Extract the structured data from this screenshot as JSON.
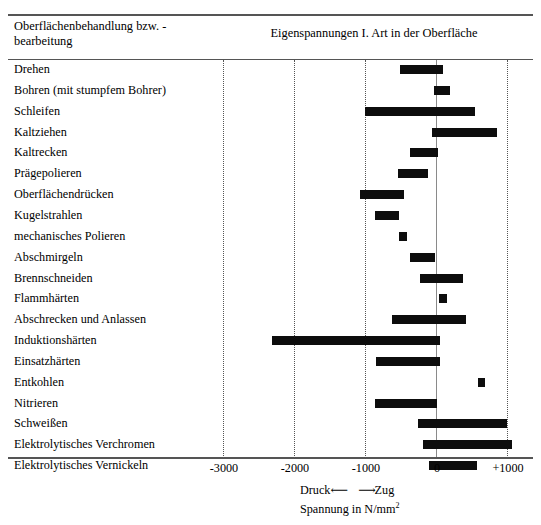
{
  "header": {
    "left_title": "Oberflächenbehandlung bzw. -bearbeitung",
    "right_title": "Eigenspannungen I. Art in der Oberfläche"
  },
  "caption": {
    "line1_left": "Druck",
    "line1_arrow": "⟵ ⟶",
    "line1_right": "Zug",
    "line2": "Spannung in N/mm",
    "line2_sup": "2"
  },
  "axis": {
    "ticks": [
      "-3000",
      "-2000",
      "-1000",
      "0",
      "+1000"
    ],
    "tick_values": [
      -3000,
      -2000,
      -1000,
      0,
      1000
    ]
  },
  "chart_data": {
    "type": "bar",
    "title": "Eigenspannungen I. Art in der Oberfläche",
    "xlabel": "Spannung in N/mm²",
    "ylabel": "Oberflächenbehandlung bzw. -bearbeitung",
    "xlim": [
      -3400,
      1200
    ],
    "orientation": "horizontal",
    "bar_type": "range",
    "grid": true,
    "legend": "none",
    "categories": [
      "Drehen",
      "Bohren (mit stumpfem Bohrer)",
      "Schleifen",
      "Kaltziehen",
      "Kaltrecken",
      "Prägepolieren",
      "Oberflächendrücken",
      "Kugelstrahlen",
      "mechanisches Polieren",
      "Abschmirgeln",
      "Brennschneiden",
      "Flammhärten",
      "Abschrecken und Anlassen",
      "Induktionshärten",
      "Einsatzhärten",
      "Entkohlen",
      "Nitrieren",
      "Schweißen",
      "Elektrolytisches Verchromen",
      "Elektrolytisches Vernickeln"
    ],
    "ranges": [
      {
        "label": "Drehen",
        "min": -510,
        "max": 100
      },
      {
        "label": "Bohren (mit stumpfem Bohrer)",
        "min": -30,
        "max": 200
      },
      {
        "label": "Schleifen",
        "min": -1000,
        "max": 550
      },
      {
        "label": "Kaltziehen",
        "min": -60,
        "max": 860
      },
      {
        "label": "Kaltrecken",
        "min": -370,
        "max": 30
      },
      {
        "label": "Prägepolieren",
        "min": -540,
        "max": -110
      },
      {
        "label": "Oberflächendrücken",
        "min": -1070,
        "max": -450
      },
      {
        "label": "Kugelstrahlen",
        "min": -860,
        "max": -520
      },
      {
        "label": "mechanisches Polieren",
        "min": -520,
        "max": -410
      },
      {
        "label": "Abschmirgeln",
        "min": -370,
        "max": -10
      },
      {
        "label": "Brennschneiden",
        "min": -230,
        "max": 380
      },
      {
        "label": "Flammhärten",
        "min": 40,
        "max": 150
      },
      {
        "label": "Abschrecken und Anlassen",
        "min": -620,
        "max": 420
      },
      {
        "label": "Induktionshärten",
        "min": -2310,
        "max": 60
      },
      {
        "label": "Einsatzhärten",
        "min": -845,
        "max": 60
      },
      {
        "label": "Entkohlen",
        "min": 590,
        "max": 690
      },
      {
        "label": "Nitrieren",
        "min": -860,
        "max": 15
      },
      {
        "label": "Schweißen",
        "min": -250,
        "max": 1000
      },
      {
        "label": "Elektrolytisches Verchromen",
        "min": -180,
        "max": 1070
      },
      {
        "label": "Elektrolytisches Vernickeln",
        "min": -100,
        "max": 580
      }
    ]
  },
  "geometry": {
    "zero_x": 436,
    "px_per_1000": 71,
    "row_top": 62,
    "row_height": 20.85,
    "bar_height": 9
  },
  "colors": {
    "bar": "#0d0d0d",
    "rule": "#555555",
    "grid": "#555555",
    "zero_axis": "#8a8a8a"
  }
}
